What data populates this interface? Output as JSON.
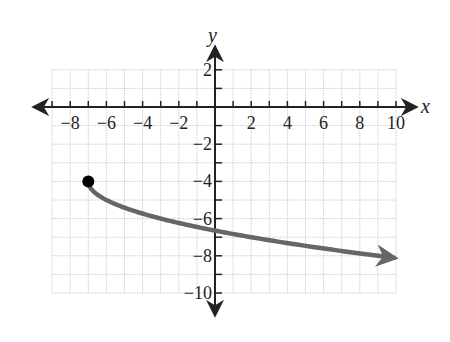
{
  "chart_data": {
    "type": "line",
    "title": "",
    "xlabel": "x",
    "ylabel": "y",
    "xlim": [
      -9,
      10
    ],
    "ylim": [
      -10,
      2
    ],
    "grid": true,
    "grid_step": 1,
    "x_tick_labels": [
      "-8",
      "-6",
      "-4",
      "-2",
      "2",
      "4",
      "6",
      "8",
      "10"
    ],
    "x_tick_values": [
      -8,
      -6,
      -4,
      -2,
      2,
      4,
      6,
      8,
      10
    ],
    "y_tick_labels": [
      "2",
      "-2",
      "-4",
      "-6",
      "-8",
      "-10"
    ],
    "y_tick_values": [
      2,
      -2,
      -4,
      -6,
      -8,
      -10
    ],
    "series": [
      {
        "name": "curve",
        "description": "Square-root style curve starting at closed point (-7, -4), decreasing, with arrow to the right",
        "start_point": {
          "x": -7,
          "y": -4,
          "closed": true
        },
        "x": [
          -7,
          -6.5,
          -6,
          -5,
          -4,
          -3,
          -2,
          -1,
          0,
          1,
          2,
          3,
          4,
          5,
          6,
          7,
          8,
          9,
          10
        ],
        "y": [
          -4,
          -4.71,
          -5,
          -5.41,
          -5.73,
          -6,
          -6.24,
          -6.45,
          -6.65,
          -6.83,
          -7,
          -7.16,
          -7.32,
          -7.46,
          -7.61,
          -7.74,
          -7.87,
          -8,
          -8.12
        ],
        "end_arrow": true,
        "color": "#666666"
      }
    ],
    "point_color": "#000000",
    "axis_color": "#222222",
    "grid_color": "#cfcfcf"
  }
}
